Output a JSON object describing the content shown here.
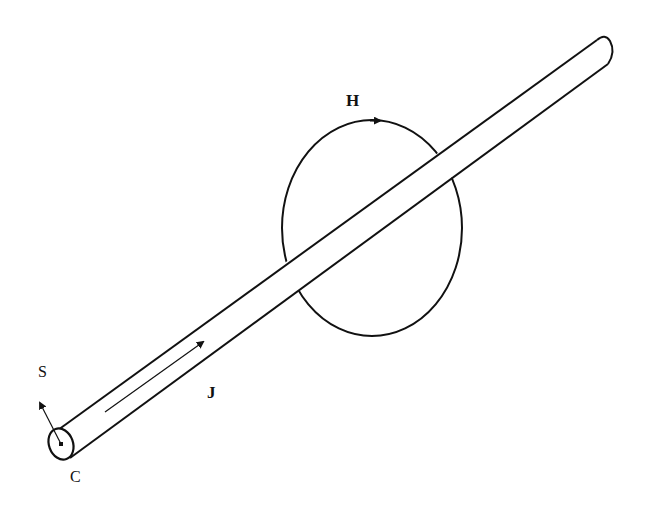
{
  "diagram": {
    "labels": {
      "H": "H",
      "J": "J",
      "S": "S",
      "C": "C"
    },
    "elements": [
      {
        "id": "conductor",
        "type": "cylinder",
        "from": [
          61,
          444
        ],
        "to": [
          605,
          52
        ]
      },
      {
        "id": "field-loop",
        "type": "ellipse",
        "center": [
          372,
          228
        ],
        "rx": 90,
        "ry": 108,
        "arrow_direction": "clockwise"
      },
      {
        "id": "current-arrow",
        "type": "arrow",
        "from": [
          105,
          412
        ],
        "to": [
          205,
          340
        ],
        "label": "J"
      },
      {
        "id": "surface-normal",
        "type": "arrow",
        "from": [
          61,
          444
        ],
        "to": [
          38,
          400
        ],
        "label": "S"
      },
      {
        "id": "cross-section",
        "type": "ellipse",
        "center": [
          61,
          444
        ],
        "rx": 12,
        "ry": 16,
        "label": "C"
      }
    ],
    "colors": {
      "stroke": "#111111",
      "background": "#ffffff"
    }
  }
}
